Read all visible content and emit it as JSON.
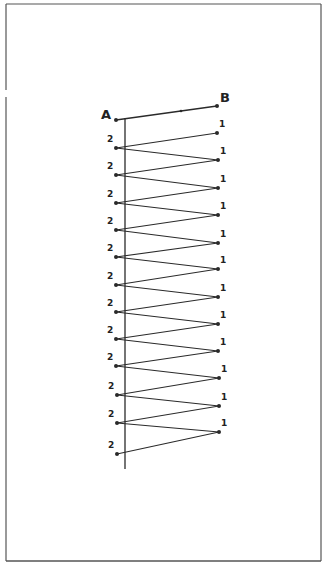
{
  "diagram": {
    "type": "zigzag-winding",
    "colors": {
      "background": "#ffffff",
      "ink": "#2a2a2a",
      "border": "#555555"
    },
    "frame": {
      "left": 6,
      "top": 4,
      "right": 321,
      "bottom": 561
    },
    "axis": {
      "x": 125,
      "y_top": 118,
      "y_bottom": 469
    },
    "endpoints": {
      "A": {
        "label": "A",
        "x": 116,
        "y": 120,
        "label_x": 101,
        "label_y": 119
      },
      "B": {
        "label": "B",
        "x": 217,
        "y": 106,
        "label_x": 220,
        "label_y": 102
      },
      "mid": {
        "x": 181,
        "y": 111
      }
    },
    "right_label": "1",
    "left_label": "2",
    "left_label_last": "2",
    "right_points": [
      {
        "x": 217,
        "y": 133
      },
      {
        "x": 218,
        "y": 160
      },
      {
        "x": 218,
        "y": 188
      },
      {
        "x": 218,
        "y": 215
      },
      {
        "x": 218,
        "y": 243
      },
      {
        "x": 218,
        "y": 269
      },
      {
        "x": 218,
        "y": 297
      },
      {
        "x": 218,
        "y": 324
      },
      {
        "x": 218,
        "y": 351
      },
      {
        "x": 219,
        "y": 378
      },
      {
        "x": 219,
        "y": 406
      },
      {
        "x": 219,
        "y": 432
      }
    ],
    "left_points": [
      {
        "x": 116,
        "y": 148
      },
      {
        "x": 116,
        "y": 175
      },
      {
        "x": 116,
        "y": 203
      },
      {
        "x": 116,
        "y": 230
      },
      {
        "x": 116,
        "y": 257
      },
      {
        "x": 116,
        "y": 285
      },
      {
        "x": 116,
        "y": 312
      },
      {
        "x": 116,
        "y": 339
      },
      {
        "x": 116,
        "y": 366
      },
      {
        "x": 117,
        "y": 395
      },
      {
        "x": 117,
        "y": 423
      },
      {
        "x": 117,
        "y": 454
      }
    ]
  }
}
